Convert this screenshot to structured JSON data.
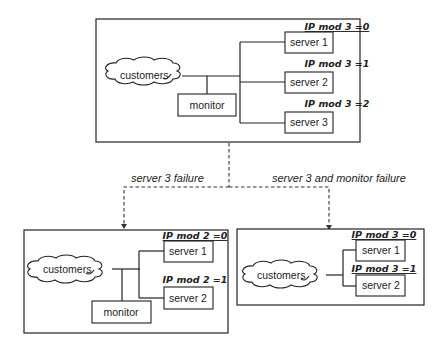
{
  "diagram": {
    "top": {
      "customers": "customers",
      "monitor": "monitor",
      "servers": [
        {
          "label": "server 1",
          "rule": "IP mod 3 =0"
        },
        {
          "label": "server 2",
          "rule": "IP mod 3 =1"
        },
        {
          "label": "server 3",
          "rule": "IP mod 3 =2"
        }
      ]
    },
    "transitions": {
      "left": "server 3 failure",
      "right": "server 3 and monitor failure"
    },
    "bottom_left": {
      "customers": "customers",
      "monitor": "monitor",
      "servers": [
        {
          "label": "server 1",
          "rule": "IP mod 2 =0"
        },
        {
          "label": "server 2",
          "rule": "IP mod 2 =1"
        }
      ]
    },
    "bottom_right": {
      "customers": "customers",
      "servers": [
        {
          "label": "server 1",
          "rule": "IP mod 3 =0"
        },
        {
          "label": "server 2",
          "rule": "IP mod 3 =1"
        }
      ]
    }
  }
}
